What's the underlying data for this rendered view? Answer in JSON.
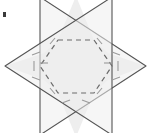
{
  "figure": {
    "shape_type": "hexagram",
    "point_count": 6,
    "fill_color": "#eeeeee",
    "outline_color": "#555555",
    "dashed_color": "#666666",
    "tick_color": "#999999",
    "background_color": "#ffffff",
    "corner_artifact_color": "#3a3a3a",
    "outer_points": [
      {
        "name": "top-right-point",
        "x": 112,
        "y": -2
      },
      {
        "name": "right-point",
        "x": 146,
        "y": 66
      },
      {
        "name": "bottom-right-point",
        "x": 112,
        "y": 135
      },
      {
        "name": "bottom-left-point",
        "x": 40,
        "y": 135
      },
      {
        "name": "left-point",
        "x": 5,
        "y": 66
      },
      {
        "name": "top-left-point",
        "x": 40,
        "y": -2
      }
    ],
    "inner_hexagon_vertices": [
      {
        "name": "hex-vertex-top",
        "x": 94,
        "y": 40
      },
      {
        "name": "hex-vertex-upper-right",
        "x": 108,
        "y": 53
      },
      {
        "name": "hex-vertex-lower-right",
        "x": 108,
        "y": 80
      },
      {
        "name": "hex-vertex-bottom",
        "x": 94,
        "y": 93
      },
      {
        "name": "hex-vertex-lower-left",
        "x": 58,
        "y": 93
      },
      {
        "name": "hex-vertex-upper-left",
        "x": 44,
        "y": 80
      },
      {
        "name": "hex-vertex-left",
        "x": 44,
        "y": 53
      },
      {
        "name": "hex-vertex-upper",
        "x": 58,
        "y": 40
      }
    ],
    "edge_tick_marks": {
      "count_per_edge": 1,
      "style": "single-hash",
      "description": "short perpendicular congruence tick on each star edge"
    },
    "dashed_edges": {
      "style": "dashed",
      "description": "inner hexagon drawn with dashed construction lines"
    }
  }
}
